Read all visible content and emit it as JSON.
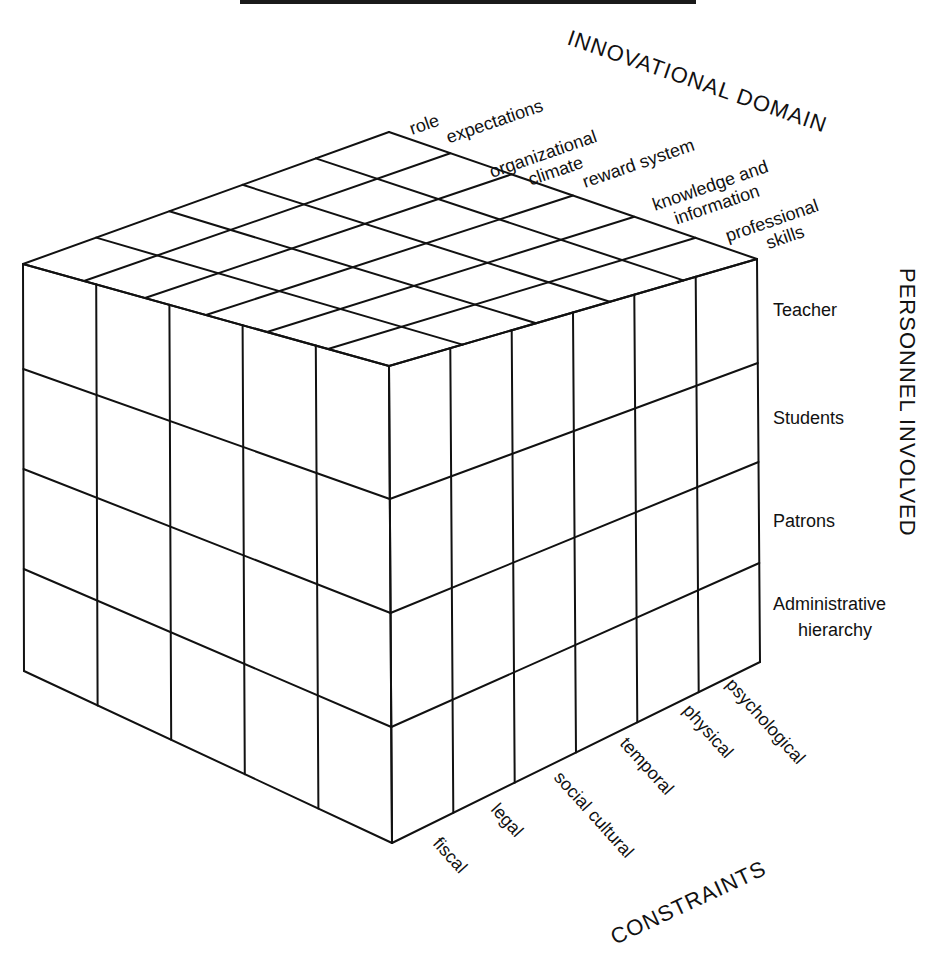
{
  "figure": {
    "rule_color": "#1a1a1a",
    "line_color": "#111111",
    "background": "#ffffff"
  },
  "axes": {
    "innovational_domain": {
      "title": "INNOVATIONAL DOMAIN",
      "categories": [
        [
          "role",
          "expectations"
        ],
        [
          "organizational",
          "climate"
        ],
        [
          "reward system"
        ],
        [
          "knowledge and",
          "information"
        ],
        [
          "professional",
          "skills"
        ]
      ]
    },
    "personnel_involved": {
      "title": "PERSONNEL INVOLVED",
      "categories": [
        [
          "Teacher"
        ],
        [
          "Students"
        ],
        [
          "Patrons"
        ],
        [
          "Administrative",
          "hierarchy"
        ]
      ]
    },
    "constraints": {
      "title": "CONSTRAINTS",
      "categories": [
        "fiscal",
        "legal",
        "social cultural",
        "temporal",
        "physical",
        "psychological"
      ]
    }
  },
  "chart_data": {
    "type": "table",
    "title": "",
    "dimensions": {
      "innovational_domain": [
        "role expectations",
        "organizational climate",
        "reward system",
        "knowledge and information",
        "professional skills"
      ],
      "personnel_involved": [
        "Teacher",
        "Students",
        "Patrons",
        "Administrative hierarchy"
      ],
      "constraints": [
        "fiscal",
        "legal",
        "social cultural",
        "temporal",
        "physical",
        "psychological"
      ]
    },
    "cell_count": 120
  },
  "cube": {
    "back_top": [
      389,
      132
    ],
    "left_top": [
      23,
      264
    ],
    "front_top": [
      389,
      366
    ],
    "right_top": [
      757,
      259
    ],
    "left_bottom": [
      24,
      671
    ],
    "front_bottom": [
      392,
      843
    ],
    "right_bottom": [
      760,
      662
    ],
    "left_rows_at_left_edge": [
      264,
      369,
      469,
      569,
      671
    ],
    "left_rows_at_front_edge": [
      366,
      499,
      613,
      727,
      843
    ],
    "right_rows_at_right_edge": [
      259,
      363,
      462,
      563,
      662
    ]
  }
}
